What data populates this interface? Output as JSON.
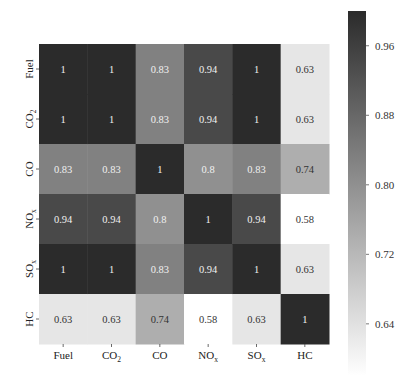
{
  "chart_data": {
    "type": "heatmap",
    "title": "",
    "xlabel": "",
    "ylabel": "",
    "x_labels": [
      {
        "base": "Fuel",
        "sub": ""
      },
      {
        "base": "CO",
        "sub": "2"
      },
      {
        "base": "CO",
        "sub": ""
      },
      {
        "base": "NO",
        "sub": "x"
      },
      {
        "base": "SO",
        "sub": "x"
      },
      {
        "base": "HC",
        "sub": ""
      }
    ],
    "y_labels": [
      {
        "base": "Fuel",
        "sub": ""
      },
      {
        "base": "CO",
        "sub": "2"
      },
      {
        "base": "CO",
        "sub": ""
      },
      {
        "base": "NO",
        "sub": "x"
      },
      {
        "base": "SO",
        "sub": "x"
      },
      {
        "base": "HC",
        "sub": ""
      }
    ],
    "values": [
      [
        1,
        1,
        0.83,
        0.94,
        1,
        0.63
      ],
      [
        1,
        1,
        0.83,
        0.94,
        1,
        0.63
      ],
      [
        0.83,
        0.83,
        1,
        0.8,
        0.83,
        0.74
      ],
      [
        0.94,
        0.94,
        0.8,
        1,
        0.94,
        0.58
      ],
      [
        1,
        1,
        0.83,
        0.94,
        1,
        0.63
      ],
      [
        0.63,
        0.63,
        0.74,
        0.58,
        0.63,
        1
      ]
    ],
    "annotations": [
      [
        "1",
        "1",
        "0.83",
        "0.94",
        "1",
        "0.63"
      ],
      [
        "1",
        "1",
        "0.83",
        "0.94",
        "1",
        "0.63"
      ],
      [
        "0.83",
        "0.83",
        "1",
        "0.8",
        "0.83",
        "0.74"
      ],
      [
        "0.94",
        "0.94",
        "0.8",
        "1",
        "0.94",
        "0.58"
      ],
      [
        "1",
        "1",
        "0.83",
        "0.94",
        "1",
        "0.63"
      ],
      [
        "0.63",
        "0.63",
        "0.74",
        "0.58",
        "0.63",
        "1"
      ]
    ],
    "colorbar": {
      "range": [
        0.58,
        1.0
      ],
      "ticks": [
        0.96,
        0.88,
        0.8,
        0.72,
        0.64
      ],
      "tick_labels": [
        "0.96",
        "0.88",
        "0.80",
        "0.72",
        "0.64"
      ],
      "colormap": "greys",
      "low_color": "#ffffff",
      "high_color": "#2b2b2b"
    },
    "grid": false,
    "legend": "colorbar-right"
  }
}
